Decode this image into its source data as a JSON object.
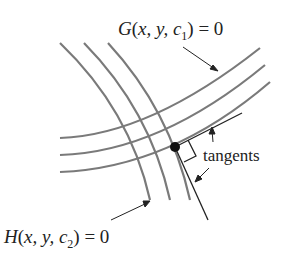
{
  "diagram": {
    "labels": {
      "g_curve": {
        "func": "G",
        "args": "x, y, c",
        "sub": "1",
        "rhs": ") = 0"
      },
      "h_curve": {
        "func": "H",
        "args": "x, y, c",
        "sub": "2",
        "rhs": ") = 0"
      },
      "tangents": "tangents"
    },
    "colors": {
      "curve": "#7a7a7a",
      "line": "#222222",
      "point": "#111111"
    }
  }
}
